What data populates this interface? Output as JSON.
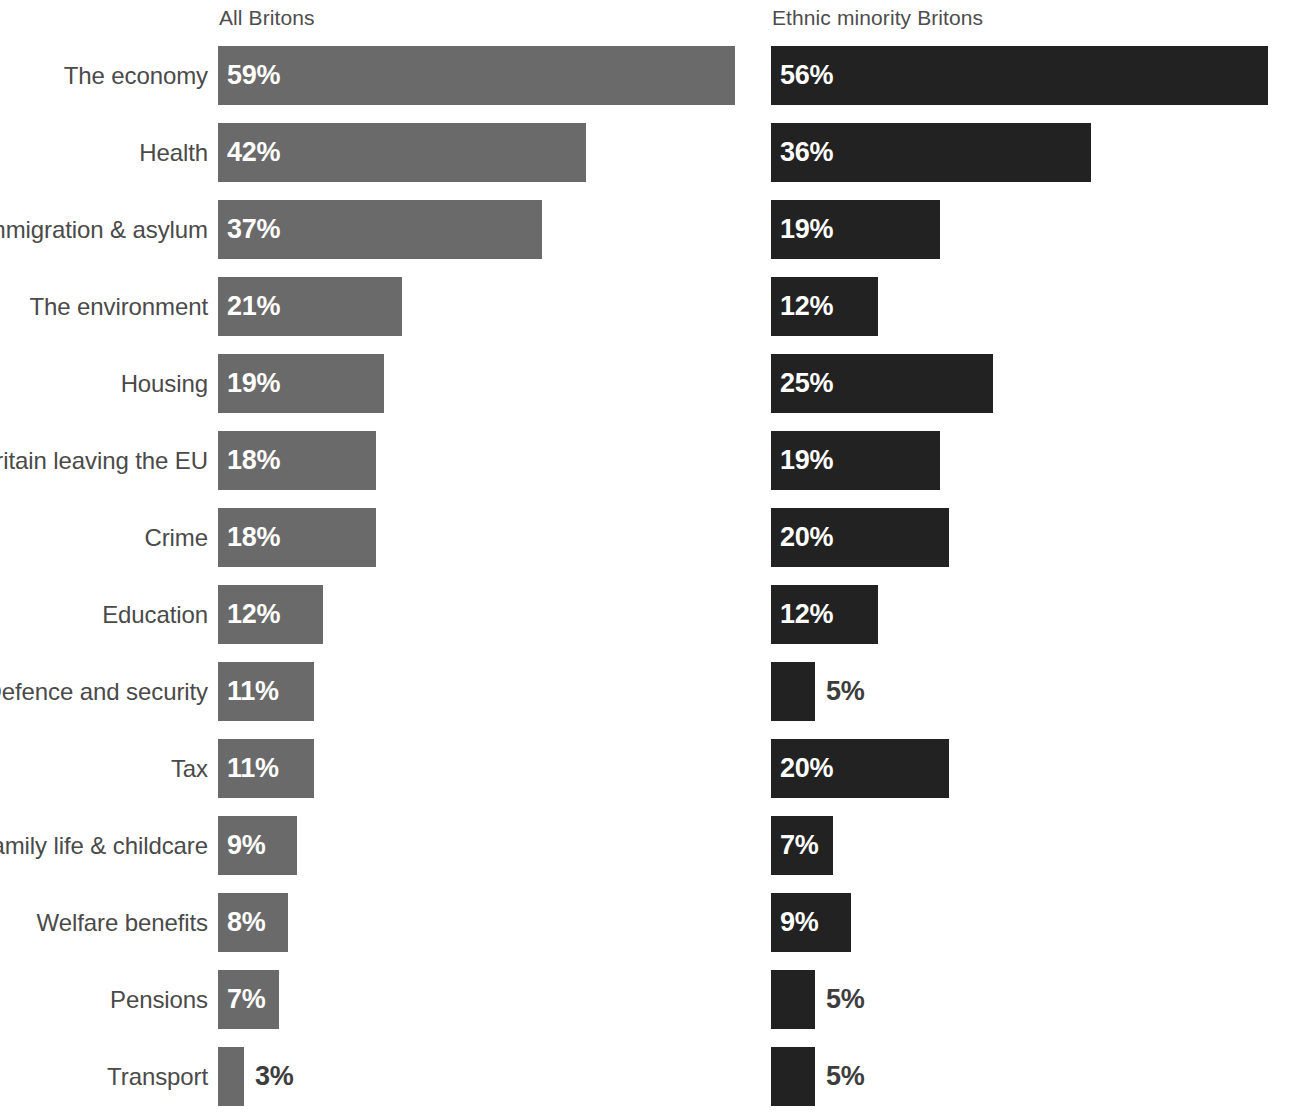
{
  "headers": {
    "left": "All Britons",
    "right": "Ethnic minority Britons"
  },
  "colors": {
    "left_bar": "#6a6a6a",
    "right_bar": "#222222",
    "label_text": "#4a4a4a",
    "header_text": "#4d4d4d",
    "value_inside": "#ffffff",
    "value_outside": "#3d3d3d",
    "background": "#ffffff"
  },
  "footnote": "",
  "chart_data": {
    "type": "bar",
    "orientation": "horizontal",
    "title": "",
    "subtitle": "",
    "xlabel": "",
    "ylabel": "",
    "grid": false,
    "legend_position": "top",
    "xlim": [
      0,
      62
    ],
    "value_suffix": "%",
    "categories": [
      "The economy",
      "Health",
      "Immigration & asylum",
      "The environment",
      "Housing",
      "Britain leaving the EU",
      "Crime",
      "Education",
      "Defence and security",
      "Tax",
      "Family life & childcare",
      "Welfare benefits",
      "Pensions",
      "Transport"
    ],
    "series": [
      {
        "name": "All Britons",
        "values": [
          59,
          42,
          37,
          21,
          19,
          18,
          18,
          12,
          11,
          11,
          9,
          8,
          7,
          3
        ],
        "labels": [
          "59%",
          "42%",
          "37%",
          "21%",
          "19%",
          "18%",
          "18%",
          "12%",
          "11%",
          "11%",
          "9%",
          "8%",
          "7%",
          "3%"
        ],
        "label_inside": [
          true,
          true,
          true,
          true,
          true,
          true,
          true,
          true,
          true,
          true,
          true,
          true,
          true,
          false
        ]
      },
      {
        "name": "Ethnic minority Britons",
        "values": [
          56,
          36,
          19,
          12,
          25,
          19,
          20,
          12,
          5,
          20,
          7,
          9,
          5,
          5
        ],
        "labels": [
          "56%",
          "36%",
          "19%",
          "12%",
          "25%",
          "19%",
          "20%",
          "12%",
          "5%",
          "20%",
          "7%",
          "9%",
          "5%",
          "5%"
        ],
        "label_inside": [
          true,
          true,
          true,
          true,
          true,
          true,
          true,
          true,
          false,
          true,
          true,
          true,
          false,
          false
        ]
      }
    ]
  }
}
